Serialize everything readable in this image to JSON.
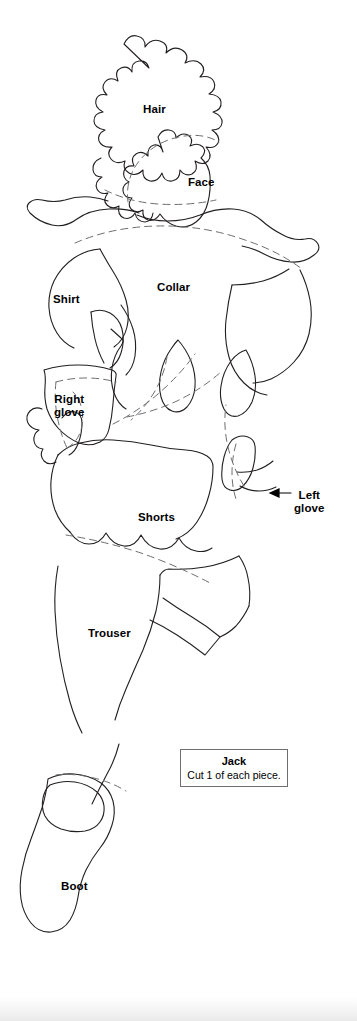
{
  "document": {
    "type": "sewing-pattern-template",
    "title": "Jack",
    "background_color": "#ffffff",
    "line_color": "#231f20",
    "dashed_line_color": "#6d6e71"
  },
  "legend": {
    "title": "Jack",
    "instruction": "Cut 1 of each piece."
  },
  "labels": [
    {
      "name": "hair",
      "text": "Hair",
      "x": 143,
      "y": 103
    },
    {
      "name": "face",
      "text": "Face",
      "x": 188,
      "y": 176
    },
    {
      "name": "collar",
      "text": "Collar",
      "x": 157,
      "y": 281
    },
    {
      "name": "shirt",
      "text": "Shirt",
      "x": 53,
      "y": 293
    },
    {
      "name": "right-glove",
      "text": "Right\nglove",
      "x": 54,
      "y": 393
    },
    {
      "name": "left-glove",
      "text": "Left\nglove",
      "x": 294,
      "y": 489
    },
    {
      "name": "shorts",
      "text": "Shorts",
      "x": 138,
      "y": 511
    },
    {
      "name": "trouser",
      "text": "Trouser",
      "x": 88,
      "y": 627
    },
    {
      "name": "boot",
      "text": "Boot",
      "x": 61,
      "y": 880
    }
  ],
  "leader": {
    "name": "left-glove-leader",
    "description": "arrow pointing left from Left glove label to pattern edge"
  }
}
